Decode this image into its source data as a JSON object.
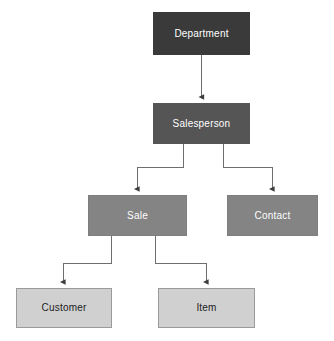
{
  "diagram": {
    "type": "tree",
    "background_color": "#ffffff",
    "edge_color": "#6e6e6e",
    "nodes": [
      {
        "id": "department",
        "label": "Department",
        "level": 0,
        "fill": "#3a3a3a",
        "text_color": "#ffffff",
        "x": 153,
        "y": 12,
        "width": 97,
        "height": 43
      },
      {
        "id": "salesperson",
        "label": "Salesperson",
        "level": 1,
        "fill": "#555555",
        "text_color": "#ffffff",
        "x": 153,
        "y": 103,
        "width": 97,
        "height": 41
      },
      {
        "id": "sale",
        "label": "Sale",
        "level": 2,
        "fill": "#848484",
        "text_color": "#ffffff",
        "x": 88,
        "y": 195,
        "width": 99,
        "height": 41
      },
      {
        "id": "contact",
        "label": "Contact",
        "level": 2,
        "fill": "#848484",
        "text_color": "#ffffff",
        "x": 227,
        "y": 195,
        "width": 91,
        "height": 41
      },
      {
        "id": "customer",
        "label": "Customer",
        "level": 3,
        "fill": "#d0d0d0",
        "text_color": "#1c1c1c",
        "x": 16,
        "y": 288,
        "width": 96,
        "height": 40
      },
      {
        "id": "item",
        "label": "Item",
        "level": 3,
        "fill": "#d0d0d0",
        "text_color": "#1c1c1c",
        "x": 158,
        "y": 288,
        "width": 97,
        "height": 40
      }
    ],
    "edges": [
      {
        "id": "department-to-salesperson",
        "from": "department",
        "to": "salesperson",
        "style": "straight",
        "arrow": true
      },
      {
        "id": "salesperson-to-sale",
        "from": "salesperson",
        "to": "sale",
        "style": "elbow",
        "arrow": true
      },
      {
        "id": "salesperson-to-contact",
        "from": "salesperson",
        "to": "contact",
        "style": "elbow",
        "arrow": true
      },
      {
        "id": "sale-to-customer",
        "from": "sale",
        "to": "customer",
        "style": "elbow",
        "arrow": true
      },
      {
        "id": "sale-to-item",
        "from": "sale",
        "to": "item",
        "style": "elbow",
        "arrow": true
      }
    ]
  }
}
